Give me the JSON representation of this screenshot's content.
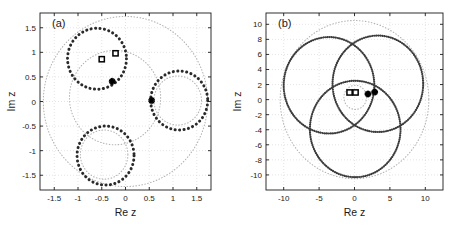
{
  "figure": {
    "background": "#ffffff",
    "panel_count": 2
  },
  "chart_data": [
    {
      "type": "scatter",
      "panel_label": "(a)",
      "title": "",
      "xlabel": "Re z",
      "ylabel": "Im z",
      "xlim": [
        -1.8,
        1.8
      ],
      "ylim": [
        -1.8,
        1.8
      ],
      "xticks": [
        -1.5,
        -1,
        -0.5,
        0,
        0.5,
        1,
        1.5
      ],
      "xtick_labels": [
        "-1.5",
        "-1",
        "-0.5",
        "0",
        "0.5",
        "1",
        "1.5"
      ],
      "yticks": [
        -1.5,
        -1,
        -0.5,
        0,
        0.5,
        1,
        1.5
      ],
      "ytick_labels": [
        "-1.5",
        "-1",
        "-0.5",
        "0",
        "0.5",
        "1",
        "1.5"
      ],
      "grid": true,
      "grid_color": "#c8c8c8",
      "legend": "none",
      "curve_color": "#2a2a2a",
      "guide_color": "#b4b4b4",
      "series": [
        {
          "name": "heavy-circle-upper-left",
          "style": "dotted-thick",
          "shape": "circle",
          "center": [
            -0.6,
            0.87
          ],
          "radius": 0.62
        },
        {
          "name": "heavy-circle-right",
          "style": "dotted-thick",
          "shape": "circle",
          "center": [
            1.13,
            0.02
          ],
          "radius": 0.6
        },
        {
          "name": "heavy-circle-lower",
          "style": "dotted-thick",
          "shape": "circle",
          "center": [
            -0.42,
            -1.1
          ],
          "radius": 0.6
        },
        {
          "name": "guide-outer-circle",
          "style": "dotted-light",
          "shape": "circle",
          "center": [
            0.0,
            0.0
          ],
          "radius": 1.73
        },
        {
          "name": "guide-circle-center",
          "style": "dotted-light",
          "shape": "circle",
          "center": [
            -0.22,
            0.08
          ],
          "radius": 0.96
        },
        {
          "name": "guide-circle-right",
          "style": "dotted-light",
          "shape": "circle",
          "center": [
            1.1,
            0.02
          ],
          "radius": 0.5
        },
        {
          "name": "guide-circle-lower",
          "style": "dotted-light",
          "shape": "circle",
          "center": [
            -0.45,
            -1.08
          ],
          "radius": 0.5
        }
      ],
      "markers": [
        {
          "name": "square-marker-1",
          "symbol": "square",
          "x": -0.5,
          "y": 0.86
        },
        {
          "name": "square-marker-2",
          "symbol": "square",
          "x": -0.21,
          "y": 0.98
        },
        {
          "name": "star-marker-1",
          "symbol": "asterisk",
          "x": -0.28,
          "y": 0.41
        },
        {
          "name": "star-marker-2",
          "symbol": "asterisk",
          "x": 0.55,
          "y": 0.02
        }
      ]
    },
    {
      "type": "scatter",
      "panel_label": "(b)",
      "title": "",
      "xlabel": "Re z",
      "ylabel": "Im z",
      "xlim": [
        -12.5,
        12.5
      ],
      "ylim": [
        -12.0,
        11.5
      ],
      "xticks": [
        -10,
        -5,
        0,
        5,
        10
      ],
      "xtick_labels": [
        "-10",
        "-5",
        "0",
        "5",
        "10"
      ],
      "yticks": [
        -10,
        -8,
        -6,
        -4,
        -2,
        0,
        2,
        4,
        6,
        8,
        10
      ],
      "ytick_labels": [
        "-10",
        "-8",
        "-6",
        "-4",
        "-2",
        "0",
        "2",
        "4",
        "6",
        "8",
        "10"
      ],
      "grid": true,
      "grid_color": "#c8c8c8",
      "legend": "none",
      "curve_color": "#3c3c3c",
      "guide_color": "#b4b4b4",
      "series": [
        {
          "name": "heavy-circle-upper-left",
          "style": "dotted-thick",
          "shape": "circle",
          "center": [
            -3.6,
            1.9
          ],
          "radius": 6.4
        },
        {
          "name": "heavy-circle-upper-right",
          "style": "dotted-thick",
          "shape": "circle",
          "center": [
            3.3,
            2.1
          ],
          "radius": 6.4
        },
        {
          "name": "heavy-circle-lower",
          "style": "dotted-thick",
          "shape": "circle",
          "center": [
            0.1,
            -3.9
          ],
          "radius": 6.4
        },
        {
          "name": "guide-outer-circle",
          "style": "dotted-light",
          "shape": "circle",
          "center": [
            0.0,
            0.0
          ],
          "radius": 10.5
        },
        {
          "name": "guide-circle-small",
          "style": "dotted-light",
          "shape": "circle",
          "center": [
            0.1,
            0.3
          ],
          "radius": 1.6
        }
      ],
      "markers": [
        {
          "name": "square-marker-1",
          "symbol": "square",
          "x": -0.7,
          "y": 0.95
        },
        {
          "name": "square-marker-2",
          "symbol": "square",
          "x": 0.15,
          "y": 0.95
        },
        {
          "name": "star-marker-1",
          "symbol": "asterisk",
          "x": 1.9,
          "y": 0.75
        },
        {
          "name": "star-marker-2",
          "symbol": "asterisk",
          "x": 2.85,
          "y": 1.0
        }
      ]
    }
  ]
}
